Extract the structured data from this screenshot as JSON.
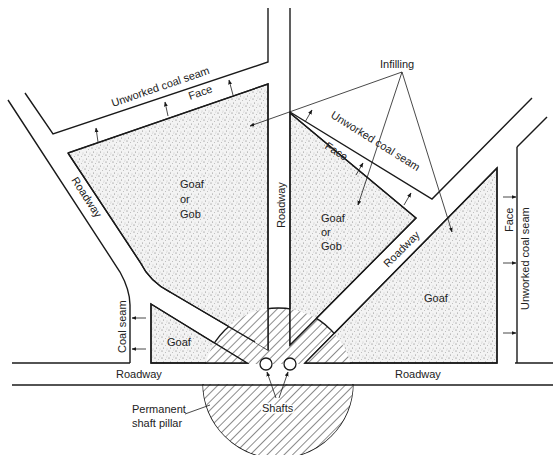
{
  "diagram": {
    "type": "mine layout plan",
    "labels": {
      "infilling": "Infilling",
      "unworked_top_left": "Unworked coal seam",
      "face_top_left": "Face",
      "unworked_middle": "Unworked coal seam",
      "face_middle": "Face",
      "unworked_right": "Unworked coal seam",
      "face_right": "Face",
      "roadway_left_diag": "Roadway",
      "roadway_middle_vertical": "Roadway",
      "roadway_right_diag": "Roadway",
      "roadway_bottom_left": "Roadway",
      "roadway_bottom_right": "Roadway",
      "goaf_left_1": "Goaf",
      "goaf_left_2": "or",
      "goaf_left_3": "Gob",
      "goaf_center_1": "Goaf",
      "goaf_center_2": "or",
      "goaf_center_3": "Gob",
      "goaf_right": "Goaf",
      "goaf_small": "Goaf",
      "coal_seam": "Coal seam",
      "shafts": "Shafts",
      "pillar_1": "Permanent",
      "pillar_2": "shaft pillar"
    },
    "colors": {
      "line": "#1a1a1a",
      "background": "#ffffff",
      "stipple": "#8a8a8a"
    }
  }
}
